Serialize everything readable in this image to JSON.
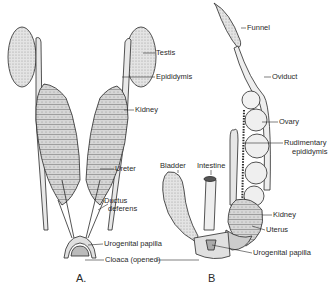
{
  "figure": {
    "panels": [
      {
        "id": "A",
        "letter": "A.",
        "labels": {
          "testis": "Testis",
          "epididymis": "Epididymis",
          "kidney": "Kidney",
          "ureter": "Ureter",
          "ductus_deferens_1": "Ductus",
          "ductus_deferens_2": "deferens",
          "urogenital_papilla": "Urogenital papilla",
          "cloaca": "Cloaca (opened)"
        }
      },
      {
        "id": "B",
        "letter": "B",
        "labels": {
          "funnel": "Funnel",
          "oviduct": "Oviduct",
          "ovary": "Ovary",
          "rudimentary_epididymis_1": "Rudimentary",
          "rudimentary_epididymis_2": "epididymis",
          "bladder": "Bladder",
          "intestine": "Intestine",
          "kidney": "Kidney",
          "uterus": "Uterus",
          "urogenital_papilla": "Urogenital papilla"
        }
      }
    ],
    "colors": {
      "ink": "#2a2a2a",
      "organ_fill": "#ececec",
      "kidney_fill": "#cfcfcf",
      "background": "#ffffff"
    }
  }
}
